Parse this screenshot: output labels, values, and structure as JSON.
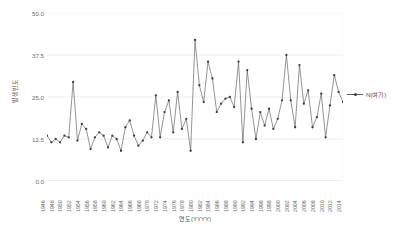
{
  "chart_data": {
    "type": "line",
    "title": "",
    "xlabel": "연도(YYYY)",
    "ylabel": "발생빈도",
    "ylim": [
      0,
      50
    ],
    "yticks": [
      "0.0",
      "12.5",
      "25.0",
      "37.5",
      "50.0"
    ],
    "ytick_values": [
      0,
      12.5,
      25,
      37.5,
      50
    ],
    "grid": true,
    "legend_position": "right",
    "series": [
      {
        "name": "N(여기)",
        "color": "#5a5a5a",
        "marker": "circle",
        "x": [
          1946,
          1947,
          1948,
          1949,
          1950,
          1951,
          1952,
          1953,
          1954,
          1955,
          1956,
          1957,
          1958,
          1959,
          1960,
          1961,
          1962,
          1963,
          1964,
          1965,
          1966,
          1967,
          1968,
          1969,
          1970,
          1971,
          1972,
          1973,
          1974,
          1975,
          1976,
          1977,
          1978,
          1979,
          1980,
          1981,
          1982,
          1983,
          1984,
          1985,
          1986,
          1987,
          1988,
          1989,
          1990,
          1991,
          1992,
          1993,
          1994,
          1995,
          1996,
          1997,
          1998,
          1999,
          2000,
          2001,
          2002,
          2003,
          2004,
          2005,
          2006,
          2007,
          2008,
          2009,
          2010,
          2011,
          2012,
          2013,
          2014
        ],
        "values": [
          13.5,
          11.5,
          12.5,
          11.5,
          13.5,
          13.0,
          29.5,
          12.0,
          17.0,
          15.5,
          9.5,
          13.0,
          14.5,
          13.5,
          10.0,
          13.5,
          12.5,
          9.0,
          16.0,
          18.0,
          13.5,
          10.5,
          12.0,
          14.5,
          13.0,
          25.5,
          13.0,
          20.5,
          24.0,
          14.5,
          26.5,
          15.5,
          18.5,
          9.0,
          42.0,
          28.5,
          23.5,
          35.5,
          30.5,
          20.5,
          23.0,
          24.5,
          25.0,
          22.0,
          35.5,
          11.5,
          33.0,
          21.5,
          12.5,
          20.5,
          16.5,
          21.5,
          15.5,
          18.5,
          24.0,
          37.5,
          24.0,
          16.0,
          34.5,
          23.0,
          27.0,
          16.0,
          19.0,
          26.0,
          13.0,
          22.5,
          31.5,
          26.5,
          23.5
        ]
      }
    ],
    "xtick_labels": [
      "1946",
      "1948",
      "1950",
      "1952",
      "1954",
      "1956",
      "1958",
      "1960",
      "1962",
      "1964",
      "1966",
      "1968",
      "1970",
      "1972",
      "1974",
      "1976",
      "1978",
      "1980",
      "1982",
      "1984",
      "1986",
      "1988",
      "1990",
      "1992",
      "1994",
      "1996",
      "1998",
      "2000",
      "2002",
      "2004",
      "2006",
      "2008",
      "2010",
      "2012",
      "2014"
    ],
    "xtick_values": [
      1946,
      1948,
      1950,
      1952,
      1954,
      1956,
      1958,
      1960,
      1962,
      1964,
      1966,
      1968,
      1970,
      1972,
      1974,
      1976,
      1978,
      1980,
      1982,
      1984,
      1986,
      1988,
      1990,
      1992,
      1994,
      1996,
      1998,
      2000,
      2002,
      2004,
      2006,
      2008,
      2010,
      2012,
      2014
    ]
  }
}
